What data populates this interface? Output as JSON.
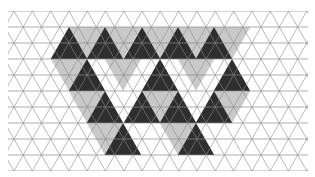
{
  "figure": {
    "width": 315,
    "height": 177
  },
  "grid": {
    "unit_side": 18.3,
    "row_height": 16,
    "origin_x": 14,
    "origin_y": 11,
    "rows": 10,
    "line_color": "#8a8a8a",
    "background": "#ffffff"
  },
  "colors": {
    "dark": "#2e2e2e",
    "light": "#c9c9c9",
    "mid": "#b4b4b4"
  },
  "dark_triangles": [
    {
      "apex_x": 69,
      "apex_y": 27,
      "size": 2
    },
    {
      "apex_x": 105,
      "apex_y": 27,
      "size": 2
    },
    {
      "apex_x": 142,
      "apex_y": 27,
      "size": 2
    },
    {
      "apex_x": 178,
      "apex_y": 27,
      "size": 2
    },
    {
      "apex_x": 214,
      "apex_y": 27,
      "size": 2
    },
    {
      "apex_x": 87,
      "apex_y": 59,
      "size": 2
    },
    {
      "apex_x": 160,
      "apex_y": 59,
      "size": 2
    },
    {
      "apex_x": 232,
      "apex_y": 59,
      "size": 2
    },
    {
      "apex_x": 105,
      "apex_y": 91,
      "size": 2
    },
    {
      "apex_x": 142,
      "apex_y": 91,
      "size": 2
    },
    {
      "apex_x": 178,
      "apex_y": 91,
      "size": 2
    },
    {
      "apex_x": 214,
      "apex_y": 91,
      "size": 2
    },
    {
      "apex_x": 123,
      "apex_y": 123,
      "size": 2
    },
    {
      "apex_x": 196,
      "apex_y": 123,
      "size": 2
    }
  ],
  "light_triangles": [
    {
      "apex_x": 87,
      "apex_y": 27,
      "size": 2,
      "down": true
    },
    {
      "apex_x": 123,
      "apex_y": 27,
      "size": 2,
      "down": true
    },
    {
      "apex_x": 160,
      "apex_y": 27,
      "size": 2,
      "down": true
    },
    {
      "apex_x": 196,
      "apex_y": 27,
      "size": 2,
      "down": true
    },
    {
      "apex_x": 232,
      "apex_y": 27,
      "size": 2,
      "down": true
    },
    {
      "apex_x": 69,
      "apex_y": 59,
      "size": 2,
      "down": true
    },
    {
      "apex_x": 123,
      "apex_y": 59,
      "size": 2,
      "down": true
    },
    {
      "apex_x": 196,
      "apex_y": 59,
      "size": 2,
      "down": true
    },
    {
      "apex_x": 87,
      "apex_y": 91,
      "size": 2,
      "down": true
    },
    {
      "apex_x": 160,
      "apex_y": 91,
      "size": 2,
      "down": true
    },
    {
      "apex_x": 232,
      "apex_y": 91,
      "size": 2,
      "down": true
    },
    {
      "apex_x": 105,
      "apex_y": 123,
      "size": 2,
      "down": true
    },
    {
      "apex_x": 178,
      "apex_y": 123,
      "size": 2,
      "down": true
    }
  ]
}
